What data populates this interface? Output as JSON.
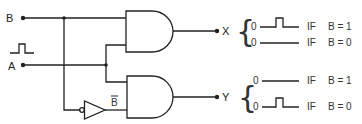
{
  "diagram": {
    "type": "logic-circuit",
    "inputs": [
      {
        "label": "B"
      },
      {
        "label": "A",
        "signal": "pulse"
      }
    ],
    "inverter_output_label": "B",
    "gates": [
      {
        "type": "AND",
        "inputs": [
          "B",
          "A"
        ],
        "output": "X"
      },
      {
        "type": "AND",
        "inputs": [
          "A",
          "NOT B"
        ],
        "output": "Y"
      }
    ],
    "outputs": [
      {
        "label": "X",
        "conditions": [
          {
            "level": "0",
            "waveform": "pulse",
            "if_label": "IF",
            "condition": "B = 1"
          },
          {
            "level": "0",
            "waveform": "flat",
            "if_label": "IF",
            "condition": "B = 0"
          }
        ]
      },
      {
        "label": "Y",
        "conditions": [
          {
            "level": "0",
            "waveform": "flat",
            "if_label": "IF",
            "condition": "B = 1"
          },
          {
            "level": "0",
            "waveform": "pulse",
            "if_label": "IF",
            "condition": "B = 0"
          }
        ]
      }
    ]
  }
}
